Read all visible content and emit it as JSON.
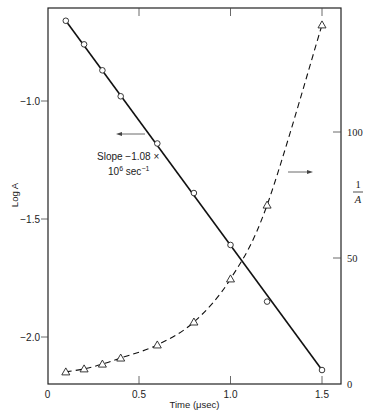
{
  "chart_data": {
    "type": "line",
    "title": "",
    "xlabel": "Time (μsec)",
    "ylabel_left": "Log A",
    "ylabel_right_num": "1",
    "ylabel_right_den": "A",
    "xlim": [
      0,
      1.6
    ],
    "ylim_left": [
      -2.2,
      -0.55
    ],
    "ylim_right": [
      0,
      149
    ],
    "x_ticks": [
      {
        "value": 0,
        "label": "0"
      },
      {
        "value": 0.5,
        "label": "0.5"
      },
      {
        "value": 1.0,
        "label": "1.0"
      },
      {
        "value": 1.5,
        "label": "1.5"
      }
    ],
    "y_left_ticks": [
      {
        "value": -1.0,
        "label": "−1.0"
      },
      {
        "value": -1.5,
        "label": "−1.5"
      },
      {
        "value": -2.0,
        "label": "−2.0"
      }
    ],
    "y_right_ticks": [
      {
        "value": 0,
        "label": "0"
      },
      {
        "value": 50,
        "label": "50"
      },
      {
        "value": 100,
        "label": "100"
      }
    ],
    "grid": false,
    "series": [
      {
        "name": "Log A",
        "axis": "left",
        "marker": "circle",
        "line": "solid",
        "x": [
          0.1,
          0.2,
          0.3,
          0.4,
          0.6,
          0.8,
          1.0,
          1.2,
          1.5
        ],
        "y": [
          -0.66,
          -0.76,
          -0.87,
          -0.98,
          -1.18,
          -1.39,
          -1.61,
          -1.85,
          -2.14
        ],
        "fit": {
          "x": [
            0.1,
            1.5
          ],
          "y": [
            -0.66,
            -2.14
          ]
        }
      },
      {
        "name": "1/A",
        "axis": "right",
        "marker": "triangle",
        "line": "dashed",
        "x": [
          0.1,
          0.2,
          0.3,
          0.4,
          0.6,
          0.8,
          1.0,
          1.2,
          1.5
        ],
        "y": [
          4.8,
          6.0,
          7.9,
          10.3,
          15.5,
          24.6,
          41.7,
          71.0,
          142.5
        ]
      }
    ],
    "annotations": {
      "slope_line1": "Slope −1.08 ×",
      "slope_line2_base": "10",
      "slope_line2_exp": "6",
      "slope_line2_unit": " sec",
      "slope_line2_unit_exp": "−1"
    }
  }
}
